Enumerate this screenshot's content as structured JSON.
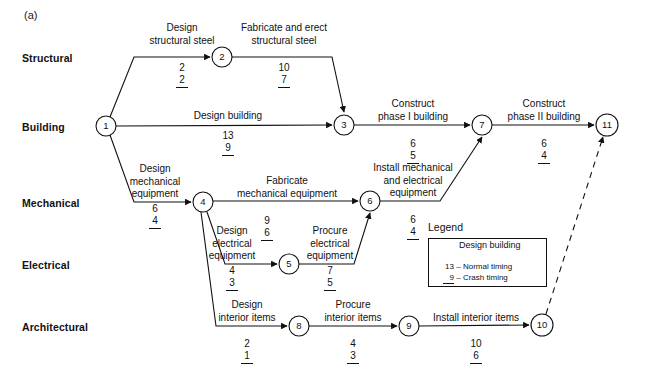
{
  "figure": {
    "panel_label": "(a)",
    "type": "activity-on-arrow project network diagram"
  },
  "rows": [
    {
      "label": "Structural",
      "x": 22,
      "y": 52
    },
    {
      "label": "Building",
      "x": 22,
      "y": 121
    },
    {
      "label": "Mechanical",
      "x": 22,
      "y": 197
    },
    {
      "label": "Electrical",
      "x": 22,
      "y": 259
    },
    {
      "label": "Architectural",
      "x": 22,
      "y": 321
    }
  ],
  "nodes": [
    {
      "id": "1",
      "cx": 106,
      "cy": 126,
      "r": 10
    },
    {
      "id": "2",
      "cx": 222,
      "cy": 57,
      "r": 10
    },
    {
      "id": "3",
      "cx": 344,
      "cy": 125,
      "r": 10
    },
    {
      "id": "4",
      "cx": 203,
      "cy": 202,
      "r": 10
    },
    {
      "id": "5",
      "cx": 289,
      "cy": 264,
      "r": 10
    },
    {
      "id": "6",
      "cx": 370,
      "cy": 201,
      "r": 10
    },
    {
      "id": "7",
      "cx": 482,
      "cy": 125,
      "r": 10
    },
    {
      "id": "8",
      "cx": 299,
      "cy": 326,
      "r": 10
    },
    {
      "id": "9",
      "cx": 409,
      "cy": 326,
      "r": 10
    },
    {
      "id": "10",
      "cx": 542,
      "cy": 325,
      "r": 11
    },
    {
      "id": "11",
      "cx": 607,
      "cy": 125,
      "r": 11
    }
  ],
  "activities": [
    {
      "name": "Design structural steel",
      "from": "1",
      "to": "2",
      "normal": "2",
      "crash": "2",
      "label_lines": [
        "Design",
        "structural steel"
      ],
      "label_x": 182,
      "label_y": 22,
      "dur_x": 182,
      "dur_y": 62
    },
    {
      "name": "Fabricate and erect structural steel",
      "from": "2",
      "to": "3",
      "normal": "10",
      "crash": "7",
      "label_lines": [
        "Fabricate and erect",
        "structural steel"
      ],
      "label_x": 284,
      "label_y": 22,
      "dur_x": 284,
      "dur_y": 62
    },
    {
      "name": "Design building",
      "from": "1",
      "to": "3",
      "normal": "13",
      "crash": "9",
      "label_lines": [
        "Design building"
      ],
      "label_x": 228,
      "label_y": 110,
      "dur_x": 228,
      "dur_y": 130
    },
    {
      "name": "Construct phase I building",
      "from": "3",
      "to": "7",
      "normal": "6",
      "crash": "5",
      "label_lines": [
        "Construct",
        "phase I building"
      ],
      "label_x": 413,
      "label_y": 98,
      "dur_x": 413,
      "dur_y": 138
    },
    {
      "name": "Construct phase II building",
      "from": "7",
      "to": "11",
      "normal": "6",
      "crash": "4",
      "label_lines": [
        "Construct",
        "phase II building"
      ],
      "label_x": 544,
      "label_y": 98,
      "dur_x": 544,
      "dur_y": 138
    },
    {
      "name": "Design mechanical equipment",
      "from": "1",
      "to": "4",
      "normal": "6",
      "crash": "4",
      "label_lines": [
        "Design",
        "mechanical",
        "equipment"
      ],
      "label_x": 155,
      "label_y": 163,
      "dur_x": 155,
      "dur_y": 203
    },
    {
      "name": "Fabricate mechanical equipment",
      "from": "4",
      "to": "6",
      "normal": "9",
      "crash": "6",
      "label_lines": [
        "Fabricate",
        "mechanical equipment"
      ],
      "label_x": 287,
      "label_y": 175,
      "dur_x": 287,
      "dur_y": 215
    },
    {
      "name": "Design electrical equipment",
      "from": "4",
      "to": "5",
      "normal": "4",
      "crash": "3",
      "label_lines": [
        "Design",
        "electrical",
        "equipment"
      ],
      "label_x": 232,
      "label_y": 225,
      "dur_x": 232,
      "dur_y": 265
    },
    {
      "name": "Procure electrical equipment",
      "from": "5",
      "to": "6",
      "normal": "7",
      "crash": "5",
      "label_lines": [
        "Procure",
        "electrical",
        "equipment"
      ],
      "label_x": 330,
      "label_y": 225,
      "dur_x": 330,
      "dur_y": 265
    },
    {
      "name": "Install mechanical and electrical equipment",
      "from": "6",
      "to": "7",
      "normal": "6",
      "crash": "4",
      "label_lines": [
        "Install mechanical",
        "and electrical",
        "equipment"
      ],
      "label_x": 413,
      "label_y": 162,
      "dur_x": 413,
      "dur_y": 214
    },
    {
      "name": "Design interior items",
      "from": "4",
      "to": "8",
      "normal": "2",
      "crash": "1",
      "label_lines": [
        "Design",
        "interior items"
      ],
      "label_x": 247,
      "label_y": 299,
      "dur_x": 247,
      "dur_y": 338
    },
    {
      "name": "Procure interior items",
      "from": "8",
      "to": "9",
      "normal": "4",
      "crash": "3",
      "label_lines": [
        "Procure",
        "interior items"
      ],
      "label_x": 353,
      "label_y": 299,
      "dur_x": 353,
      "dur_y": 338
    },
    {
      "name": "Install interior items",
      "from": "9",
      "to": "10",
      "normal": "10",
      "crash": "6",
      "label_lines": [
        "Install interior items"
      ],
      "label_x": 476,
      "label_y": 312,
      "dur_x": 476,
      "dur_y": 338
    },
    {
      "name": "dummy activity",
      "from": "10",
      "to": "11",
      "normal": "",
      "crash": "",
      "label_lines": [],
      "dashed": true
    }
  ],
  "legend": {
    "title": "Legend",
    "activity_label": "Design building",
    "normal_value": "13",
    "normal_text": "– Normal timing",
    "crash_value": "9",
    "crash_text": "– Crash timing",
    "box": {
      "x": 428,
      "y": 238,
      "w": 117,
      "h": 47
    }
  },
  "colors": {
    "line": "#111111",
    "text": "#111111",
    "background": "#ffffff"
  }
}
